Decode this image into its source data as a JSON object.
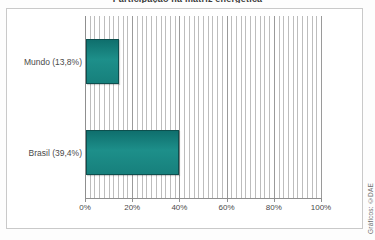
{
  "chart_data": {
    "type": "bar",
    "orientation": "horizontal",
    "title": "Participação na matriz energética",
    "categories": [
      "Mundo (13,8%)",
      "Brasil (39,4%)"
    ],
    "category_labels": [
      "Mundo (13,8%)",
      "Brasil (39,4%)"
    ],
    "values": [
      13.8,
      39.4
    ],
    "value_suffix": "%",
    "xlabel": "",
    "ylabel": "",
    "xlim": [
      0,
      100
    ],
    "xticks": [
      0,
      20,
      40,
      60,
      80,
      100
    ],
    "xtick_labels": [
      "0%",
      "20%",
      "40%",
      "60%",
      "80%",
      "100%"
    ],
    "minor_gridline_step": 2,
    "grid": true,
    "legend": false,
    "bar_color": "#17807c",
    "bar_border_color": "#0d4f4e",
    "axis_color": "#8f8f8f",
    "gridline_color": "#bdbdbd"
  },
  "credit": {
    "text": "Gráficos: ©DAE"
  }
}
